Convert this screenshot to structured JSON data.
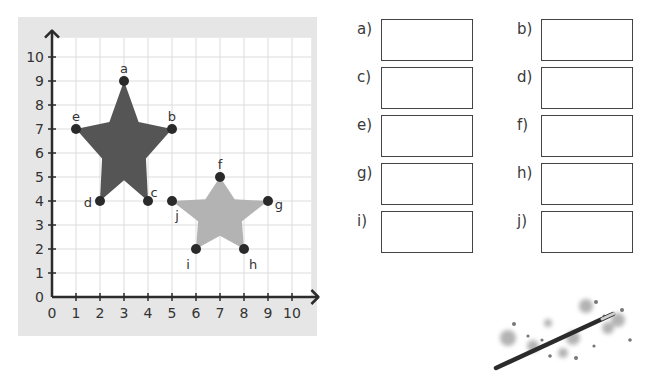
{
  "chart_data": {
    "type": "scatter",
    "title": "",
    "xlabel": "",
    "ylabel": "",
    "xlim": [
      0,
      10
    ],
    "ylim": [
      0,
      10
    ],
    "x_ticks": [
      "0",
      "1",
      "2",
      "3",
      "4",
      "5",
      "6",
      "7",
      "8",
      "9",
      "10"
    ],
    "y_ticks": [
      "0",
      "1",
      "2",
      "3",
      "4",
      "5",
      "6",
      "7",
      "8",
      "9",
      "10"
    ],
    "grid": true,
    "series": [
      {
        "name": "dark star",
        "color": "#555555",
        "points": [
          {
            "label": "a",
            "x": 3,
            "y": 9
          },
          {
            "label": "b",
            "x": 5,
            "y": 7
          },
          {
            "label": "c",
            "x": 4,
            "y": 4
          },
          {
            "label": "d",
            "x": 2,
            "y": 4
          },
          {
            "label": "e",
            "x": 1,
            "y": 7
          }
        ]
      },
      {
        "name": "light star",
        "color": "#b3b3b3",
        "points": [
          {
            "label": "f",
            "x": 7,
            "y": 5
          },
          {
            "label": "g",
            "x": 9,
            "y": 4
          },
          {
            "label": "h",
            "x": 8,
            "y": 2
          },
          {
            "label": "i",
            "x": 6,
            "y": 2
          },
          {
            "label": "j",
            "x": 5,
            "y": 4
          }
        ]
      }
    ]
  },
  "answers": [
    {
      "label": "a)",
      "value": ""
    },
    {
      "label": "b)",
      "value": ""
    },
    {
      "label": "c)",
      "value": ""
    },
    {
      "label": "d)",
      "value": ""
    },
    {
      "label": "e)",
      "value": ""
    },
    {
      "label": "f)",
      "value": ""
    },
    {
      "label": "g)",
      "value": ""
    },
    {
      "label": "h)",
      "value": ""
    },
    {
      "label": "i)",
      "value": ""
    },
    {
      "label": "j)",
      "value": ""
    }
  ],
  "decoration": {
    "icon": "magic-wand-icon"
  }
}
